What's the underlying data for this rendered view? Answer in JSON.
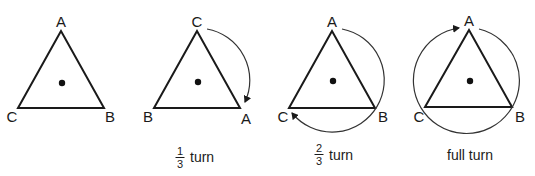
{
  "diagram": {
    "colors": {
      "stroke": "#1a1a1a",
      "arc": "#333333",
      "background": "#ffffff"
    },
    "panels": [
      {
        "id": "original",
        "vertices": {
          "top": "A",
          "left": "C",
          "right": "B"
        },
        "caption": "",
        "rotation": "none"
      },
      {
        "id": "one-third",
        "vertices": {
          "top": "C",
          "left": "B",
          "right": "A"
        },
        "caption": {
          "numerator": "1",
          "denominator": "3",
          "word": "turn"
        },
        "rotation": "1/3 clockwise"
      },
      {
        "id": "two-thirds",
        "vertices": {
          "top": "A",
          "left": "C",
          "right": "B"
        },
        "caption": {
          "numerator": "2",
          "denominator": "3",
          "word": "turn"
        },
        "rotation": "2/3 clockwise"
      },
      {
        "id": "full",
        "vertices": {
          "top": "A",
          "left": "C",
          "right": "B"
        },
        "caption": {
          "text": "full turn"
        },
        "rotation": "full clockwise"
      }
    ]
  }
}
